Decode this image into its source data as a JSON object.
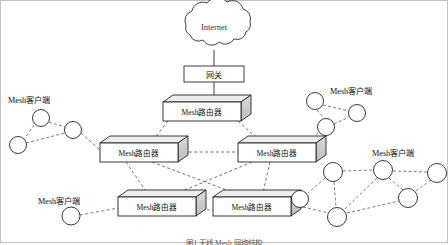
{
  "figure": {
    "caption": "图1  无线 Mesh 网络结构",
    "border_color": "#b8b8b8",
    "background": "#ffffff",
    "link_color": "#555555",
    "node_stroke": "#222222",
    "router_fill": "#ffffff",
    "router_side_fill": "#d4d4d4",
    "router_top_fill": "#ededed"
  },
  "cloud": {
    "label": "Internet",
    "cx": 214,
    "cy": 27
  },
  "gateway": {
    "label": "网关",
    "x": 184,
    "y": 66,
    "w": 60,
    "h": 16
  },
  "routers": [
    {
      "id": "r-top",
      "label": "Mesh路由器",
      "x": 163,
      "y": 102,
      "w": 78,
      "h": 19
    },
    {
      "id": "r-mid-left",
      "label": "Mesh路由器",
      "x": 100,
      "y": 143,
      "w": 78,
      "h": 19
    },
    {
      "id": "r-mid-right",
      "label": "Mesh路由器",
      "x": 238,
      "y": 143,
      "w": 78,
      "h": 19
    },
    {
      "id": "r-bottom-left",
      "label": "Mesh路由器",
      "x": 118,
      "y": 197,
      "w": 78,
      "h": 19
    },
    {
      "id": "r-bottom-right",
      "label": "Mesh路由器",
      "x": 213,
      "y": 197,
      "w": 78,
      "h": 19
    }
  ],
  "client_labels": [
    {
      "id": "cl-top-left",
      "text": "Mesh客户端",
      "x": 8,
      "y": 97
    },
    {
      "id": "cl-top-right",
      "text": "Mesh客户端",
      "x": 330,
      "y": 88
    },
    {
      "id": "cl-bottom-left",
      "text": "Mesh客户端",
      "x": 38,
      "y": 198
    },
    {
      "id": "cl-bottom-right",
      "text": "Mesh客户端",
      "x": 372,
      "y": 150
    }
  ],
  "clusters": [
    {
      "id": "cluster-top-left",
      "nodes": [
        {
          "id": "tl1",
          "cx": 41,
          "cy": 118,
          "r": 8.5
        },
        {
          "id": "tl2",
          "cx": 73,
          "cy": 130,
          "r": 8.5
        },
        {
          "id": "tl3",
          "cx": 18,
          "cy": 145,
          "r": 8.5
        }
      ],
      "edges": [
        [
          "tl1",
          "tl2"
        ],
        [
          "tl1",
          "tl3"
        ],
        [
          "tl2",
          "tl3"
        ]
      ]
    },
    {
      "id": "cluster-top-right",
      "nodes": [
        {
          "id": "tr1",
          "cx": 315,
          "cy": 101,
          "r": 8.5
        },
        {
          "id": "tr2",
          "cx": 357,
          "cy": 113,
          "r": 8.5
        },
        {
          "id": "tr3",
          "cx": 326,
          "cy": 127,
          "r": 8.5
        }
      ],
      "edges": [
        [
          "tr1",
          "tr2"
        ],
        [
          "tr1",
          "tr3"
        ],
        [
          "tr2",
          "tr3"
        ]
      ]
    },
    {
      "id": "cluster-bottom-left",
      "nodes": [
        {
          "id": "bl1",
          "cx": 71,
          "cy": 216,
          "r": 9
        }
      ],
      "edges": []
    },
    {
      "id": "cluster-bottom-right",
      "nodes": [
        {
          "id": "br1",
          "cx": 333,
          "cy": 172,
          "r": 9.5
        },
        {
          "id": "br2",
          "cx": 383,
          "cy": 170,
          "r": 9.5
        },
        {
          "id": "br3",
          "cx": 437,
          "cy": 173,
          "r": 9.5
        },
        {
          "id": "br4",
          "cx": 300,
          "cy": 199,
          "r": 8.5
        },
        {
          "id": "br5",
          "cx": 408,
          "cy": 198,
          "r": 9.5
        },
        {
          "id": "br6",
          "cx": 337,
          "cy": 217,
          "r": 9.5
        }
      ],
      "edges": [
        [
          "br1",
          "br2"
        ],
        [
          "br2",
          "br3"
        ],
        [
          "br1",
          "br4"
        ],
        [
          "br1",
          "br6"
        ],
        [
          "br2",
          "br6"
        ],
        [
          "br2",
          "br5"
        ],
        [
          "br3",
          "br5"
        ],
        [
          "br4",
          "br6"
        ],
        [
          "br5",
          "br6"
        ]
      ]
    }
  ],
  "links": {
    "cloud_to_gateway": "solid",
    "gateway_to_router": "solid",
    "router_mesh": "dashed",
    "router_to_client": "dashed",
    "client_mesh": "dashed"
  },
  "backbone_edges": [
    [
      "r-top",
      "r-mid-left"
    ],
    [
      "r-top",
      "r-mid-right"
    ],
    [
      "r-mid-left",
      "r-mid-right"
    ],
    [
      "r-mid-left",
      "r-bottom-left"
    ],
    [
      "r-mid-left",
      "r-bottom-right"
    ],
    [
      "r-mid-right",
      "r-bottom-left"
    ],
    [
      "r-mid-right",
      "r-bottom-right"
    ],
    [
      "r-bottom-left",
      "r-bottom-right"
    ]
  ],
  "access_edges": [
    [
      "tl2",
      "r-mid-left"
    ],
    [
      "tr3",
      "r-mid-right"
    ],
    [
      "bl1",
      "r-bottom-left"
    ],
    [
      "br4",
      "r-bottom-right"
    ]
  ]
}
